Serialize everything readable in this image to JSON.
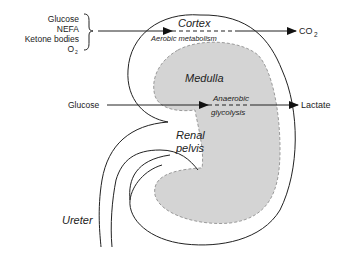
{
  "inputs_top": {
    "items": [
      "Glucose",
      "NEFA",
      "Ketone bodies",
      "O"
    ],
    "o2_subscript": "2"
  },
  "regions": {
    "cortex": "Cortex",
    "medulla": "Medulla",
    "renal_pelvis_line1": "Renal",
    "renal_pelvis_line2": "pelvis",
    "ureter": "Ureter"
  },
  "processes": {
    "aerobic": "Aerobic metabolism",
    "anaerobic_line1": "Anaerobic",
    "anaerobic_line2": "glycolysis"
  },
  "inputs_middle": {
    "glucose": "Glucose"
  },
  "outputs": {
    "co2": "CO",
    "co2_subscript": "2",
    "lactate": "Lactate"
  },
  "colors": {
    "line": "#222222",
    "medulla_fill": "#d4d4d4",
    "medulla_stroke": "#999999"
  }
}
